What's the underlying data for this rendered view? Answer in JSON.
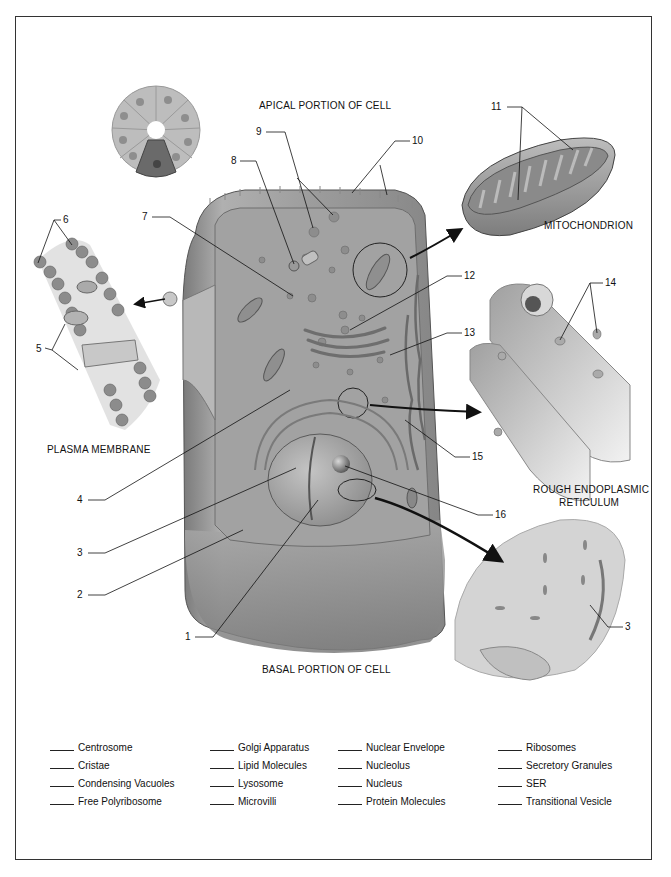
{
  "titles": {
    "apical": "APICAL PORTION OF CELL",
    "basal": "BASAL PORTION OF CELL",
    "mitochondrion": "MITOCHONDRION",
    "plasma_membrane": "PLASMA MEMBRANE",
    "rer_line1": "ROUGH ENDOPLASMIC",
    "rer_line2": "RETICULUM"
  },
  "callouts": [
    "1",
    "2",
    "3",
    "4",
    "5",
    "6",
    "7",
    "8",
    "9",
    "10",
    "11",
    "12",
    "13",
    "14",
    "15",
    "16",
    "3"
  ],
  "key": {
    "columns": [
      [
        "Centrosome",
        "Cristae",
        "Condensing Vacuoles",
        "Free Polyribosome"
      ],
      [
        "Golgi Apparatus",
        "Lipid Molecules",
        "Lysosome",
        "Microvilli"
      ],
      [
        "Nuclear Envelope",
        "Nucleolus",
        "Nucleus",
        "Protein Molecules"
      ],
      [
        "Ribosomes",
        "Secretory Granules",
        "SER",
        "Transitional Vesicle"
      ]
    ]
  },
  "colors": {
    "frame": "#333333",
    "cell_fill": "#9a9a9a",
    "cell_dark": "#6e6e6e",
    "cell_light": "#c8c8c8"
  }
}
